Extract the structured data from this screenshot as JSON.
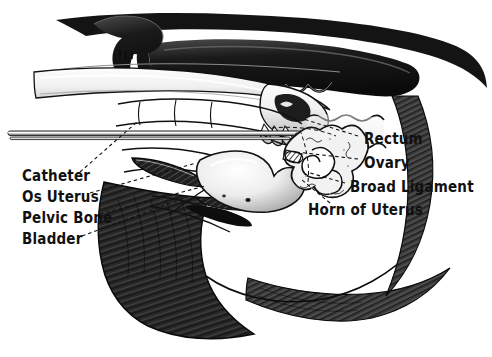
{
  "figure": {
    "background_color": "#ffffff",
    "ink_color": "#111111",
    "style": "pen-and-ink hand-drawn anatomical illustration"
  },
  "labels": {
    "left": [
      {
        "id": "catheter",
        "text": "Catheter",
        "x": 22,
        "y": 176
      },
      {
        "id": "os-uterus",
        "text": "Os Uterus",
        "x": 22,
        "y": 197
      },
      {
        "id": "pelvic-bone",
        "text": "Pelvic Bone",
        "x": 22,
        "y": 218
      },
      {
        "id": "bladder",
        "text": "Bladder",
        "x": 22,
        "y": 239
      }
    ],
    "right": [
      {
        "id": "rectum",
        "text": "Rectum",
        "x": 364,
        "y": 139
      },
      {
        "id": "ovary",
        "text": "Ovary",
        "x": 364,
        "y": 163
      },
      {
        "id": "broad-ligament",
        "text": "Broad Ligament",
        "x": 350,
        "y": 187
      },
      {
        "id": "horn-of-uterus",
        "text": "Horn of Uterus",
        "x": 308,
        "y": 210
      }
    ]
  },
  "leader_lines": [
    {
      "id": "catheter-leader",
      "from": [
        80,
        172
      ],
      "to": [
        137,
        122
      ]
    },
    {
      "id": "os-uterus-leader",
      "from": [
        90,
        193
      ],
      "to": [
        196,
        163
      ]
    },
    {
      "id": "pelvic-bone-leader",
      "from": [
        100,
        214
      ],
      "to": [
        205,
        186
      ]
    },
    {
      "id": "bladder-leader",
      "from": [
        82,
        236
      ],
      "to": [
        190,
        196
      ]
    },
    {
      "id": "rectum-leader",
      "from": [
        358,
        136
      ],
      "to": [
        300,
        118
      ]
    },
    {
      "id": "ovary-leader",
      "from": [
        358,
        159
      ],
      "to": [
        296,
        152
      ]
    },
    {
      "id": "broad-lig-leader",
      "from": [
        345,
        183
      ],
      "to": [
        310,
        173
      ]
    },
    {
      "id": "horn-leader",
      "from": [
        330,
        203
      ],
      "to": [
        302,
        180
      ]
    }
  ],
  "anatomy_parts": [
    {
      "id": "sacrum-vertebrae",
      "name": "sacrum and vertebrae"
    },
    {
      "id": "ilium-hook-bone",
      "name": "ilium / hook bone"
    },
    {
      "id": "arm",
      "name": "inseminator arm"
    },
    {
      "id": "hand",
      "name": "inseminator hand"
    },
    {
      "id": "catheter-rod",
      "name": "insemination catheter"
    },
    {
      "id": "rectum-body",
      "name": "rectum"
    },
    {
      "id": "bladder-body",
      "name": "bladder"
    },
    {
      "id": "uterine-horn",
      "name": "horn of uterus"
    },
    {
      "id": "ovary-body",
      "name": "ovary"
    },
    {
      "id": "cervix-os",
      "name": "os uterus / cervix"
    },
    {
      "id": "pelvic-bone-body",
      "name": "pelvic bone"
    },
    {
      "id": "body-outline",
      "name": "cow body outline"
    },
    {
      "id": "tail",
      "name": "tail"
    }
  ]
}
